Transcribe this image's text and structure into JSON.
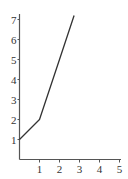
{
  "chart_data": {
    "type": "line",
    "title": "",
    "xlabel": "",
    "ylabel": "",
    "xlim": [
      0,
      5
    ],
    "ylim": [
      0,
      7
    ],
    "grid": false,
    "legend": null,
    "x_ticks": [
      "1",
      "2",
      "3",
      "4",
      "5"
    ],
    "y_ticks": [
      "1",
      "2",
      "3",
      "4",
      "5",
      "6",
      "7"
    ],
    "series": [
      {
        "name": "f(x)",
        "x": [
          0,
          1,
          2,
          2.73
        ],
        "values": [
          1,
          2,
          5,
          7.2
        ]
      }
    ],
    "colors": {
      "line": "#333333",
      "axis": "#555555",
      "text": "#333333"
    }
  }
}
